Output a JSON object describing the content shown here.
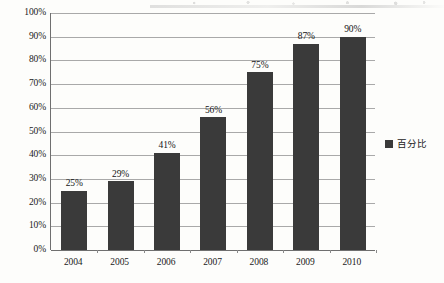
{
  "chart_data": {
    "type": "bar",
    "title": "",
    "xlabel": "",
    "ylabel": "",
    "categories": [
      "2004",
      "2005",
      "2006",
      "2007",
      "2008",
      "2009",
      "2010"
    ],
    "values": [
      25,
      29,
      41,
      56,
      75,
      87,
      90
    ],
    "value_labels": [
      "25%",
      "29%",
      "41%",
      "56%",
      "75%",
      "87%",
      "90%"
    ],
    "series": [
      {
        "name": "百分比",
        "values": [
          25,
          29,
          41,
          56,
          75,
          87,
          90
        ],
        "color": "#3a3a3a"
      }
    ],
    "ylim": [
      0,
      100
    ],
    "ytick_values": [
      0,
      10,
      20,
      30,
      40,
      50,
      60,
      70,
      80,
      90,
      100
    ],
    "ytick_labels": [
      "0%",
      "10%",
      "20%",
      "30%",
      "40%",
      "50%",
      "60%",
      "70%",
      "80%",
      "90%",
      "100%"
    ],
    "grid": true,
    "legend_position": "right",
    "legend_entries": [
      "百分比"
    ],
    "bar_color": "#3a3a3a",
    "gridline_color": "#a9a9a9",
    "axis_color": "#6f6f6f",
    "background_color": "#fdfdfb"
  },
  "legend": {
    "label": "百分比"
  }
}
